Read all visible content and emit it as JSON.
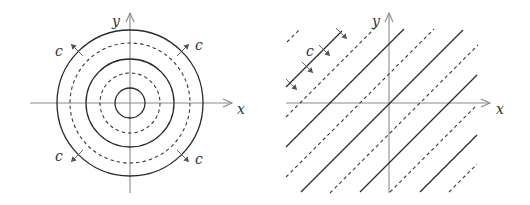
{
  "figure": {
    "left_panel": {
      "title": "concentric level sets",
      "axis_labels": {
        "x": "x",
        "y": "y"
      },
      "center": [
        130,
        103
      ],
      "circles": [
        {
          "r": 15,
          "style": "solid"
        },
        {
          "r": 30,
          "style": "dashed"
        },
        {
          "r": 44,
          "style": "solid"
        },
        {
          "r": 60,
          "style": "dashed"
        },
        {
          "r": 73,
          "style": "solid"
        }
      ],
      "flow_labels": [
        "c",
        "c",
        "c",
        "c"
      ]
    },
    "right_panel": {
      "title": "parallel level sets",
      "axis_labels": {
        "x": "x",
        "y": "y"
      },
      "origin": [
        389,
        103
      ],
      "line_spacing_px": 30,
      "flow_label": "c"
    }
  }
}
